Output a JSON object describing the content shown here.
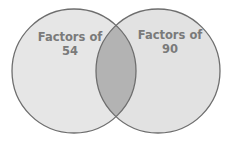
{
  "diagram": {
    "type": "venn",
    "sets": [
      {
        "label_line1": "Factors of",
        "label_line2": "54"
      },
      {
        "label_line1": "Factors of",
        "label_line2": "90"
      }
    ],
    "colors": {
      "circle_fill": "#e6e6e6",
      "overlap_fill": "#b3b3b3",
      "stroke": "#6e6e6e",
      "text": "#7a7a7a"
    }
  }
}
